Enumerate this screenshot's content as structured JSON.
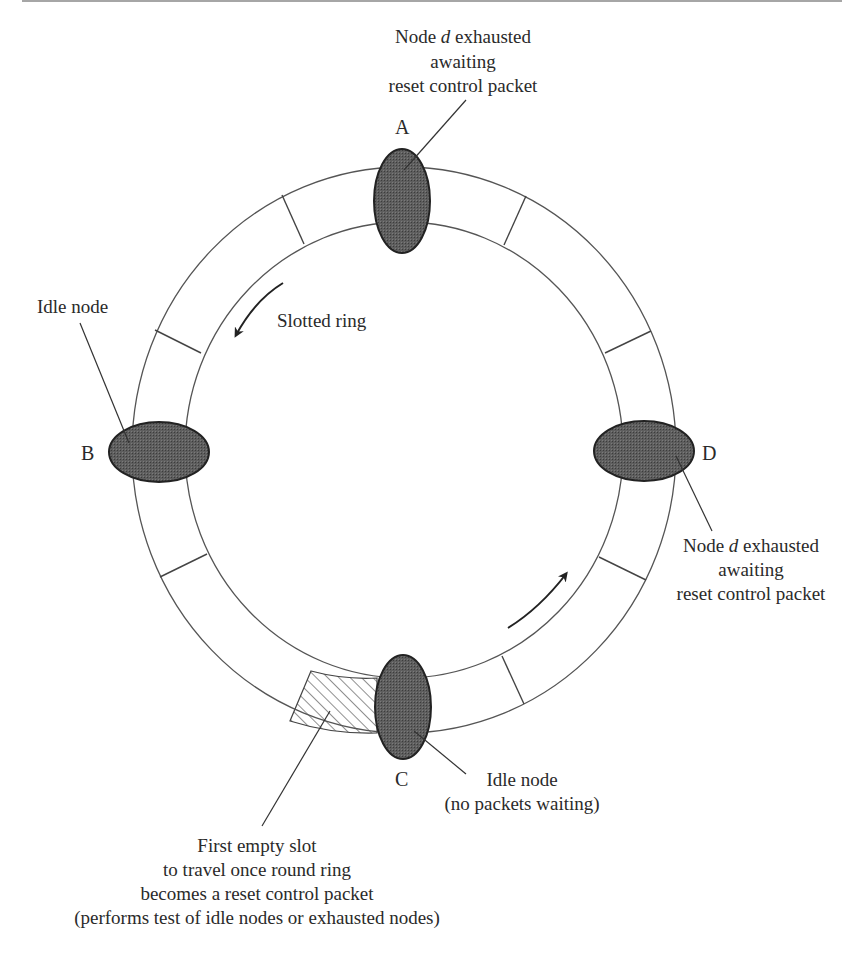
{
  "figure": {
    "type": "slotted-ring-diagram",
    "ring_label": "Slotted ring",
    "nodes": [
      {
        "id": "A",
        "label": "A",
        "annotation": [
          "Node d exhausted",
          "awaiting",
          "reset control packet"
        ],
        "state": "exhausted"
      },
      {
        "id": "B",
        "label": "B",
        "annotation": [
          "Idle node"
        ],
        "state": "idle"
      },
      {
        "id": "C",
        "label": "C",
        "annotation": [
          "Idle node",
          "(no packets waiting)"
        ],
        "state": "idle"
      },
      {
        "id": "D",
        "label": "D",
        "annotation": [
          "Node d exhausted",
          "awaiting",
          "reset control packet"
        ],
        "state": "exhausted"
      }
    ],
    "labels": {
      "top_line1_pre": "Node ",
      "top_line1_italic": "d",
      "top_line1_post": " exhausted",
      "top_line2": "awaiting",
      "top_line3": "reset control packet",
      "right_line1_pre": "Node ",
      "right_line1_italic": "d",
      "right_line1_post": " exhausted",
      "right_line2": "awaiting",
      "right_line3": "reset control packet",
      "left_idle": "Idle node",
      "bottom_idle_line1": "Idle node",
      "bottom_idle_line2": "(no packets waiting)",
      "slot_line1": "First empty slot",
      "slot_line2": "to travel once round ring",
      "slot_line3": "becomes a reset control packet",
      "slot_line4": "(performs test of idle nodes or exhausted nodes)"
    },
    "colors": {
      "node_fill": "#5a5a5a",
      "ring_stroke": "#555555",
      "text": "#2a2a2a",
      "background": "#ffffff"
    }
  }
}
